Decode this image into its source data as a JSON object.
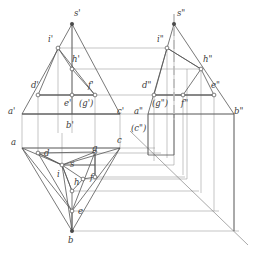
{
  "drawing": {
    "title": "Three-view orthographic projection of truncated pyramid",
    "subject": "pyramid S-ABC with cutting-plane section D E F G H I",
    "colors": {
      "line": "#555555",
      "projector": "#8a8a8a",
      "axis": "#9a9a9a",
      "label": "#3a3a3a",
      "background": "#ffffff",
      "vertex_fill": "#ffffff"
    },
    "views": {
      "front": {
        "name": "front-view",
        "note": "V-projection, single-prime labels",
        "labels": [
          {
            "id": "s-front",
            "text": "s'",
            "x": 74,
            "y": 16,
            "px": 72,
            "py": 24
          },
          {
            "id": "i-front",
            "text": "i'",
            "x": 48,
            "y": 42,
            "px": 58,
            "py": 48
          },
          {
            "id": "h-front",
            "text": "h'",
            "x": 72,
            "y": 62,
            "px": 72,
            "py": 69
          },
          {
            "id": "d-front",
            "text": "d'",
            "x": 31,
            "y": 88,
            "px": 38,
            "py": 95
          },
          {
            "id": "f-front",
            "text": "f'",
            "x": 88,
            "y": 88,
            "px": 95,
            "py": 95
          },
          {
            "id": "e-front",
            "text": "e'",
            "x": 77,
            "y": 106,
            "px": 72,
            "py": 95
          },
          {
            "id": "g-front",
            "text": "(g')",
            "x": 90,
            "y": 106,
            "px": 95,
            "py": 95
          },
          {
            "id": "a-front",
            "text": "a'",
            "x": 12,
            "y": 114,
            "px": 22,
            "py": 114
          },
          {
            "id": "c-front",
            "text": "c'",
            "x": 118,
            "y": 114,
            "px": 120,
            "py": 114
          },
          {
            "id": "b-front",
            "text": "b'",
            "x": 68,
            "y": 126,
            "px": 72,
            "py": 114
          }
        ]
      },
      "side": {
        "name": "side-view",
        "note": "W-projection, double-prime labels",
        "labels": [
          {
            "id": "s-side",
            "text": "s\"",
            "x": 178,
            "y": 16,
            "px": 174,
            "py": 24
          },
          {
            "id": "i-side",
            "text": "i\"",
            "x": 158,
            "y": 42,
            "px": 167,
            "py": 48
          },
          {
            "id": "h-side",
            "text": "h\"",
            "x": 204,
            "y": 62,
            "px": 201,
            "py": 69
          },
          {
            "id": "d-side",
            "text": "d\"",
            "x": 143,
            "y": 88,
            "px": 154,
            "py": 95
          },
          {
            "id": "e-side",
            "text": "e\"",
            "x": 214,
            "y": 88,
            "px": 214,
            "py": 95
          },
          {
            "id": "g-side",
            "text": "(g\")",
            "x": 157,
            "y": 106,
            "px": 154,
            "py": 95
          },
          {
            "id": "f-side",
            "text": "f\"",
            "x": 187,
            "y": 106,
            "px": 183,
            "py": 95
          },
          {
            "id": "a-side",
            "text": "a\"",
            "x": 139,
            "y": 114,
            "px": 148,
            "py": 114
          },
          {
            "id": "b-side",
            "text": "b\"",
            "x": 236,
            "y": 114,
            "px": 234,
            "py": 114
          },
          {
            "id": "c-side",
            "text": "(c\")",
            "x": 136,
            "y": 130,
            "px": 148,
            "py": 114
          }
        ]
      },
      "top": {
        "name": "top-view",
        "note": "H-projection, plain lowercase labels",
        "labels": [
          {
            "id": "a-top",
            "text": "a",
            "x": 14,
            "y": 142,
            "px": 22,
            "py": 148
          },
          {
            "id": "c-top",
            "text": "c",
            "x": 118,
            "y": 142,
            "px": 120,
            "py": 148
          },
          {
            "id": "d-top",
            "text": "d",
            "x": 44,
            "y": 155,
            "px": 38,
            "py": 153
          },
          {
            "id": "g-top",
            "text": "g",
            "x": 93,
            "y": 153,
            "px": 95,
            "py": 152
          },
          {
            "id": "s-top",
            "text": "s",
            "x": 70,
            "y": 165,
            "px": 62,
            "py": 165
          },
          {
            "id": "i-top",
            "text": "i",
            "x": 56,
            "y": 176,
            "px": 62,
            "py": 165
          },
          {
            "id": "h-top",
            "text": "h",
            "x": 76,
            "y": 184,
            "px": 83,
            "py": 179
          },
          {
            "id": "f-top",
            "text": "f",
            "x": 92,
            "y": 180,
            "px": 95,
            "py": 177
          },
          {
            "id": "e-top",
            "text": "e",
            "x": 78,
            "y": 212,
            "px": 72,
            "py": 211
          },
          {
            "id": "b-top",
            "text": "b",
            "x": 69,
            "y": 241,
            "px": 72,
            "py": 231
          }
        ]
      },
      "miter": {
        "name": "miter-line",
        "note": "45-degree transfer line between top and side views"
      }
    }
  }
}
